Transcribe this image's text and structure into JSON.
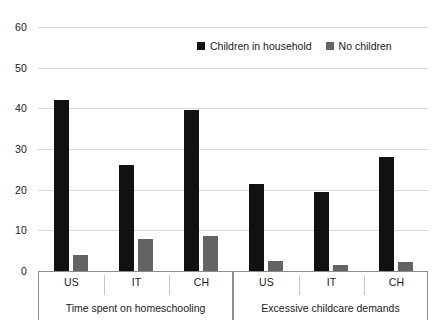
{
  "chart_data": {
    "type": "bar",
    "title": "",
    "subtitle": "",
    "xlabel": "",
    "ylabel": "",
    "ylim": [
      0,
      60
    ],
    "yticks": [
      0,
      10,
      20,
      30,
      40,
      50,
      60
    ],
    "ytick_labels": [
      "0",
      "10",
      "20",
      "30",
      "40",
      "50",
      "60"
    ],
    "grid": true,
    "legend_position": "top-center",
    "groups": [
      {
        "label": "Time spent on homeschooling",
        "categories": [
          "US",
          "IT",
          "CH"
        ]
      },
      {
        "label": "Excessive childcare demands",
        "categories": [
          "US",
          "IT",
          "CH"
        ]
      }
    ],
    "categories": [
      "US",
      "IT",
      "CH",
      "US",
      "IT",
      "CH"
    ],
    "series": [
      {
        "name": "Children in household",
        "color": "#111111",
        "values": [
          42.0,
          26.0,
          39.7,
          21.4,
          19.5,
          28.1
        ]
      },
      {
        "name": "No children",
        "color": "#636363",
        "values": [
          4.0,
          7.9,
          8.6,
          2.5,
          1.5,
          2.2
        ]
      }
    ]
  },
  "legend": {
    "entries": [
      {
        "label": "Children in household",
        "swatch": "black-square-swatch"
      },
      {
        "label": "No children",
        "swatch": "gray-square-swatch"
      }
    ]
  },
  "axis": {
    "y_labels": [
      "60",
      "50",
      "40",
      "30",
      "20",
      "10",
      "0"
    ],
    "group_labels": [
      "Time spent on homeschooling",
      "Excessive childcare demands"
    ],
    "category_labels": [
      "US",
      "IT",
      "CH",
      "US",
      "IT",
      "CH"
    ]
  },
  "colors": {
    "series_a": "#111111",
    "series_b": "#636363",
    "gridline": "#d9d9d9",
    "axis": "#8c8c8c",
    "background": "#ffffff",
    "text": "#1a1a1a"
  }
}
